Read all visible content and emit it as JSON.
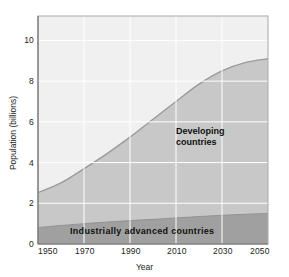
{
  "chart_data": {
    "type": "area",
    "title": "",
    "xlabel": "Year",
    "ylabel": "Population (billions)",
    "xlim": [
      1950,
      2050
    ],
    "ylim": [
      0,
      11.2
    ],
    "grid": true,
    "legend_position": "inline-labels",
    "xticks": [
      "1950",
      "1970",
      "1990",
      "2010",
      "2030",
      "2050"
    ],
    "xtick_values": [
      1950,
      1970,
      1990,
      2010,
      2030,
      2050
    ],
    "yticks": [
      "0",
      "2",
      "4",
      "6",
      "8",
      "10"
    ],
    "ytick_values": [
      0,
      2,
      4,
      6,
      8,
      10
    ],
    "x": [
      1950,
      1960,
      1970,
      1980,
      1990,
      2000,
      2010,
      2020,
      2030,
      2040,
      2050
    ],
    "series": [
      {
        "name": "Industrially advanced countries",
        "label": "Industrially advanced countries",
        "color": "#a0a0a0",
        "values": [
          0.81,
          0.91,
          1.0,
          1.08,
          1.15,
          1.21,
          1.28,
          1.35,
          1.41,
          1.46,
          1.5
        ]
      },
      {
        "name": "Developing countries",
        "label": "Developing countries",
        "color": "#c8c8c8",
        "values": [
          1.71,
          2.09,
          2.7,
          3.36,
          4.1,
          4.92,
          5.72,
          6.5,
          7.09,
          7.45,
          7.6
        ]
      }
    ],
    "total_population": [
      2.52,
      3.0,
      3.7,
      4.44,
      5.25,
      6.13,
      7.0,
      7.85,
      8.5,
      8.91,
      9.1
    ],
    "colors": {
      "plot_background": "#f0f0f0",
      "developing_band": "#c8c8c8",
      "advanced_band": "#a0a0a0",
      "gridline": "#ffffff",
      "curve_line": "#9a9a9a",
      "plot_border": "#b8b8b8",
      "text": "#1c1c1c"
    }
  },
  "axes": {
    "y_title": "Population (billions)",
    "x_title": "Year"
  },
  "labels": {
    "developing_line1": "Developing",
    "developing_line2": "countries",
    "advanced": "Industrially advanced countries"
  }
}
